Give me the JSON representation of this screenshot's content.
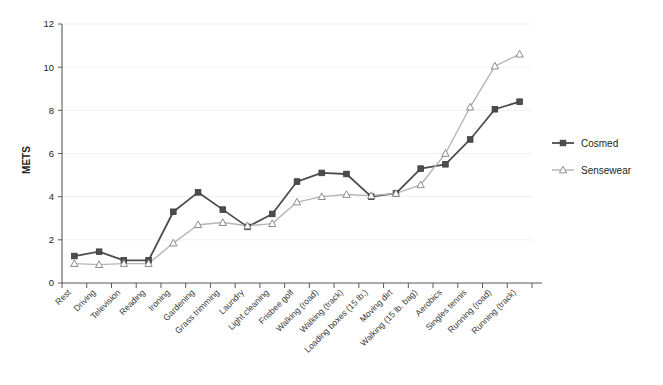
{
  "chart_data": {
    "type": "line",
    "title": "",
    "xlabel": "",
    "ylabel": "METS",
    "ylim": [
      0,
      12
    ],
    "yticks": [
      0,
      2,
      4,
      6,
      8,
      10,
      12
    ],
    "grid": true,
    "legend_position": "right",
    "categories": [
      "Rest",
      "Driving",
      "Television",
      "Reading",
      "Ironing",
      "Gardening",
      "Grass trimming",
      "Laundry",
      "Light cleaning",
      "Frisbee golf",
      "Walking (road)",
      "Walking (track)",
      "Loading boxes (15 lb.)",
      "Moving dirt",
      "Walking (15 lb. bag)",
      "Aerobics",
      "Singles tennis",
      "Running (road)",
      "Running (track)"
    ],
    "series": [
      {
        "name": "Cosmed",
        "color": "#4d4d4d",
        "marker": "square",
        "values": [
          1.25,
          1.45,
          1.05,
          1.05,
          3.3,
          4.2,
          3.4,
          2.6,
          3.2,
          4.7,
          5.1,
          5.05,
          4.0,
          4.15,
          5.3,
          5.5,
          6.65,
          8.05,
          8.4
        ]
      },
      {
        "name": "Sensewear",
        "color": "#b5b5b5",
        "marker": "triangle",
        "values": [
          0.9,
          0.85,
          0.9,
          0.9,
          1.85,
          2.7,
          2.8,
          2.65,
          2.75,
          3.75,
          4.0,
          4.1,
          4.05,
          4.15,
          4.55,
          6.0,
          8.15,
          10.05,
          10.6
        ]
      }
    ]
  },
  "legend": {
    "items": [
      {
        "label": "Cosmed"
      },
      {
        "label": "Sensewear"
      }
    ]
  },
  "axes": {
    "y_title": "METS"
  }
}
